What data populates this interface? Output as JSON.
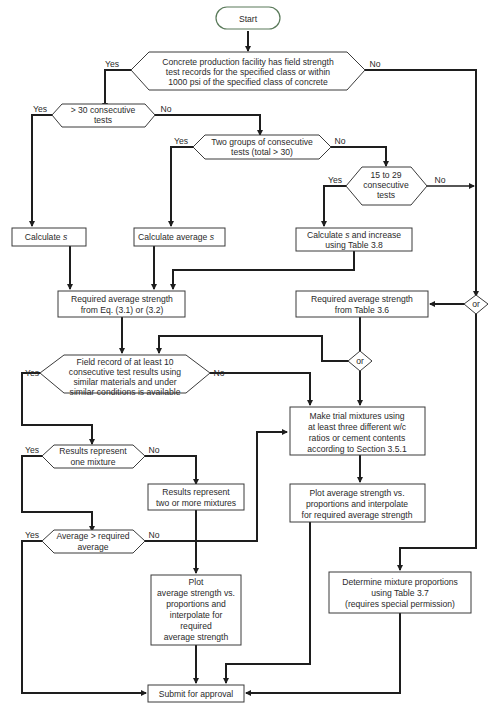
{
  "diagram": {
    "type": "flowchart",
    "colors": {
      "line": "#1e1e1e",
      "box_border": "#3a3a3a",
      "start_border": "#5a7a5a",
      "background": "#ffffff"
    },
    "nodes": {
      "start": {
        "label": "Start"
      },
      "d_records": {
        "lines": [
          "Concrete production facility has field strength",
          "test records for the specified class or within",
          "1000 psi of the specified class of concrete"
        ],
        "yes": "Yes",
        "no": "No"
      },
      "d_30": {
        "lines": [
          "> 30 consecutive",
          "tests"
        ],
        "yes": "Yes",
        "no": "No"
      },
      "d_two_groups": {
        "lines": [
          "Two groups of consecutive",
          "tests (total > 30)"
        ],
        "yes": "Yes",
        "no": "No"
      },
      "d_15_29": {
        "lines": [
          "15 to 29",
          "consecutive",
          "tests"
        ],
        "yes": "Yes",
        "no": "No"
      },
      "p_calc_s": {
        "text": "Calculate ",
        "var": "s"
      },
      "p_calc_avg_s": {
        "text": "Calculate average ",
        "var": "s"
      },
      "p_calc_s_increase": {
        "line1_text": "Calculate ",
        "line1_var": "s",
        "line1_rest": " and increase",
        "line2": "using Table 3.8"
      },
      "p_req_eq": {
        "lines": [
          "Required average strength",
          "from Eq. (3.1) or (3.2)"
        ]
      },
      "p_req_table": {
        "lines": [
          "Required average strength",
          "from Table 3.6"
        ]
      },
      "or_right": {
        "label": "or"
      },
      "or_mid": {
        "label": "or"
      },
      "d_field_record": {
        "lines": [
          "Field record of at least 10",
          "consecutive test results using",
          "similar materials and under",
          "similar conditions is available"
        ],
        "yes": "Yes",
        "no": "No"
      },
      "p_trial": {
        "lines": [
          "Make trial mixtures using",
          "at least three different w/c",
          "ratios or cement contents",
          "according to Section 3.5.1"
        ]
      },
      "d_one_mixture": {
        "lines": [
          "Results represent",
          "one mixture"
        ],
        "yes": "Yes",
        "no": "No"
      },
      "p_two_more": {
        "lines": [
          "Results represent",
          "two or more mixtures"
        ]
      },
      "p_plot_trial": {
        "lines": [
          "Plot average strength vs.",
          "proportions and interpolate",
          "for required average strength"
        ]
      },
      "d_average": {
        "lines": [
          "Average > required",
          "average"
        ],
        "yes": "Yes",
        "no": "No"
      },
      "p_plot_left": {
        "lines": [
          "Plot",
          "average strength vs.",
          "proportions and",
          "interpolate for",
          "required",
          "average strength"
        ]
      },
      "p_determine": {
        "lines": [
          "Determine mixture proportions",
          "using Table 3.7",
          "(requires special permission)"
        ]
      },
      "p_submit": {
        "label": "Submit for approval"
      }
    }
  }
}
